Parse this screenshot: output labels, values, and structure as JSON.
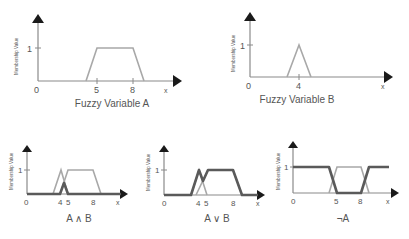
{
  "y_axis_label": "Membership Value",
  "charts": [
    {
      "id": "A",
      "caption": "Fuzzy Variable A",
      "ticks": {
        "origin": "0",
        "one": "1",
        "t1": "5",
        "t2": "8",
        "xvar": "x"
      },
      "shape": "trapezoid",
      "points": [
        [
          4,
          0
        ],
        [
          5,
          1
        ],
        [
          8,
          1
        ],
        [
          9,
          0
        ]
      ]
    },
    {
      "id": "B",
      "caption": "Fuzzy Variable B",
      "ticks": {
        "origin": "0",
        "one": "1",
        "t1": "4",
        "xvar": "x"
      },
      "shape": "triangle",
      "points": [
        [
          3,
          0
        ],
        [
          4,
          1
        ],
        [
          5,
          0
        ]
      ]
    },
    {
      "id": "AandB",
      "caption": "A ∧ B",
      "ticks": {
        "origin": "0",
        "one": "1",
        "t1": "4",
        "t2": "5",
        "t3": "8",
        "xvar": "x"
      },
      "operation": "min(A, B)"
    },
    {
      "id": "AorB",
      "caption": "A ∨ B",
      "ticks": {
        "origin": "0",
        "one": "1",
        "t1": "4",
        "t2": "5",
        "t3": "8",
        "xvar": "x"
      },
      "operation": "max(A, B)"
    },
    {
      "id": "notA",
      "caption": "¬A",
      "ticks": {
        "origin": "0",
        "one": "1",
        "t1": "5",
        "t2": "8",
        "xvar": "x"
      },
      "operation": "1 - A"
    }
  ],
  "colors": {
    "axis": "#8a8a8a",
    "arrow": "#1a1a1a",
    "input_set": "#a8a8a8",
    "result_set": "#5a5a5a"
  }
}
